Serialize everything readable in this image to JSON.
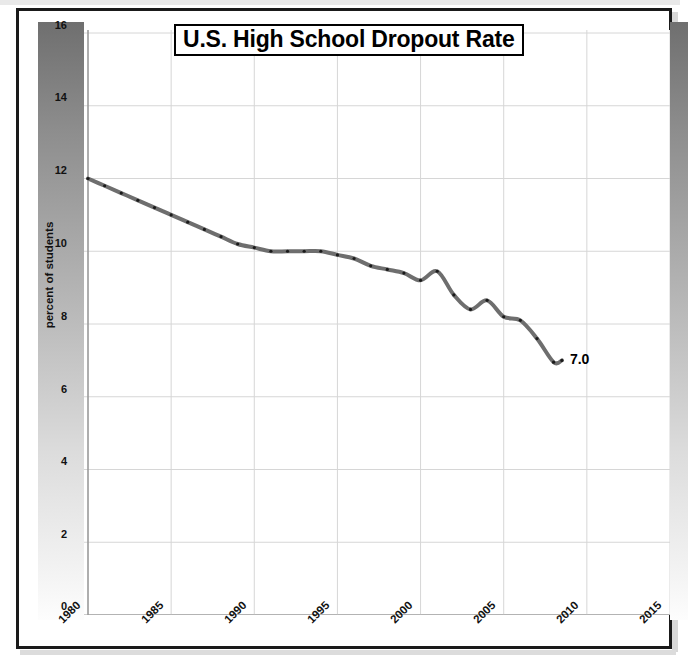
{
  "chart_data": {
    "type": "line",
    "title": "U.S. High School Dropout Rate",
    "xlabel": "",
    "ylabel": "percent of students",
    "xlim": [
      1980,
      2015
    ],
    "ylim": [
      0,
      16
    ],
    "xticks": [
      "1980",
      "1985",
      "1990",
      "1995",
      "2000",
      "2005",
      "2010",
      "2015"
    ],
    "yticks": [
      "0",
      "2",
      "4",
      "6",
      "8",
      "10",
      "12",
      "14",
      "16"
    ],
    "grid": true,
    "legend": "none",
    "line_color": "#6e6e6e",
    "marker_color": "#1a1a1a",
    "endpoint_annotation": "7.0",
    "series": [
      {
        "name": "U.S. high school dropout rate",
        "x": [
          1980,
          1981,
          1982,
          1983,
          1984,
          1985,
          1986,
          1987,
          1988,
          1989,
          1990,
          1991,
          1992,
          1993,
          1994,
          1995,
          1996,
          1997,
          1998,
          1999,
          2000,
          2001,
          2002,
          2003,
          2004,
          2005,
          2006,
          2007,
          2008,
          2008.5
        ],
        "values": [
          12.0,
          11.8,
          11.6,
          11.4,
          11.2,
          11.0,
          10.8,
          10.6,
          10.4,
          10.2,
          10.1,
          10.0,
          10.0,
          10.0,
          10.0,
          9.9,
          9.8,
          9.6,
          9.5,
          9.4,
          9.2,
          9.45,
          8.8,
          8.4,
          8.65,
          8.2,
          8.1,
          7.6,
          6.95,
          7.0
        ]
      }
    ]
  },
  "chart": {
    "title": "U.S. High School Dropout Rate",
    "y_axis_title": "percent of students",
    "y_ticks": [
      {
        "label": "16",
        "value": 16
      },
      {
        "label": "14",
        "value": 14
      },
      {
        "label": "12",
        "value": 12
      },
      {
        "label": "10",
        "value": 10
      },
      {
        "label": "8",
        "value": 8
      },
      {
        "label": "6",
        "value": 6
      },
      {
        "label": "4",
        "value": 4
      },
      {
        "label": "2",
        "value": 2
      },
      {
        "label": "0",
        "value": 0
      }
    ],
    "x_ticks": [
      {
        "label": "1980",
        "value": 1980
      },
      {
        "label": "1985",
        "value": 1985
      },
      {
        "label": "1990",
        "value": 1990
      },
      {
        "label": "1995",
        "value": 1995
      },
      {
        "label": "2000",
        "value": 2000
      },
      {
        "label": "2005",
        "value": 2005
      },
      {
        "label": "2010",
        "value": 2010
      },
      {
        "label": "2015",
        "value": 2015
      }
    ],
    "endpoint_label": "7.0",
    "colors": {
      "line": "#6e6e6e",
      "marker": "#1a1a1a",
      "grid": "#d6d6d6",
      "axis": "#9a9a9a",
      "border": "#1a1a1a",
      "panel_dark": "#6f6f6f",
      "panel_light": "#fdfdfd"
    }
  }
}
